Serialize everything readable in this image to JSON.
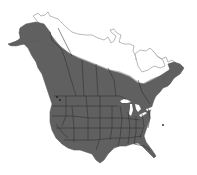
{
  "map": {
    "title": "Range map of North America",
    "region": "North America",
    "legend": [],
    "colors": {
      "background": "#ffffff",
      "range_fill": "#606060",
      "boundary_lines": "#2e2e2e",
      "unshaded_outline": "#8a8a8a",
      "water": "#ffffff"
    },
    "shaded_area": "Most of United States and southern/central Canada including Alaska interior",
    "unshaded_area": "Arctic Canada, northern Quebec/Labrador, northern Alaska coast, Arctic islands"
  }
}
